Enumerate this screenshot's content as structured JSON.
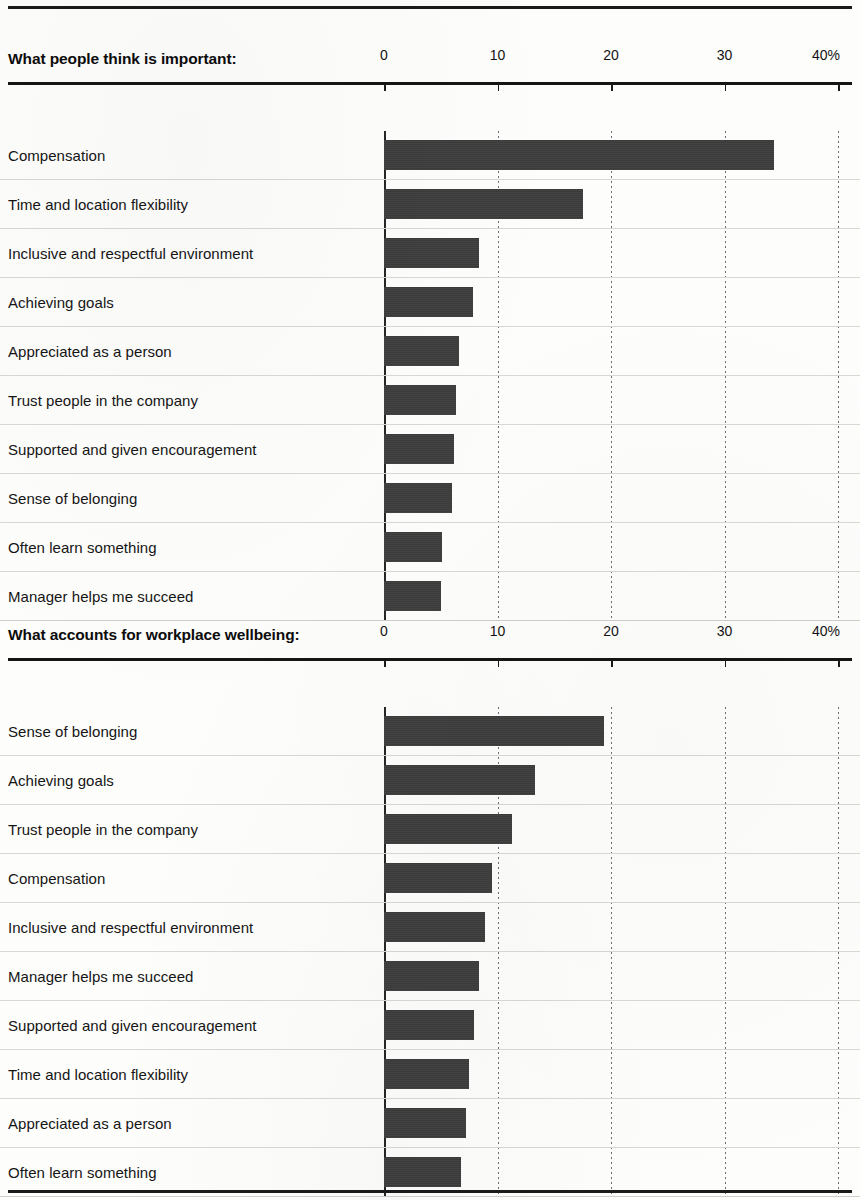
{
  "colors": {
    "bar": "#3b3b3b",
    "rule": "#1a1a1a",
    "gridline": "#6e6e6e",
    "text": "#151515",
    "background": "#fdfdfc"
  },
  "axis": {
    "ticks": [
      "0",
      "10",
      "20",
      "30",
      "40%"
    ],
    "min": 0,
    "max": 40,
    "unit": "%"
  },
  "charts": [
    {
      "title": "What people think is important:",
      "rows": [
        {
          "label": "Compensation",
          "value": 34.4
        },
        {
          "label": "Time and location flexibility",
          "value": 17.5
        },
        {
          "label": "Inclusive and respectful environment",
          "value": 8.4
        },
        {
          "label": "Achieving goals",
          "value": 7.8
        },
        {
          "label": "Appreciated as a person",
          "value": 6.6
        },
        {
          "label": "Trust people in the company",
          "value": 6.3
        },
        {
          "label": "Supported and given encouragement",
          "value": 6.2
        },
        {
          "label": "Sense of belonging",
          "value": 6.0
        },
        {
          "label": "Often learn something",
          "value": 5.1
        },
        {
          "label": "Manager helps me succeed",
          "value": 5.0
        }
      ]
    },
    {
      "title": "What accounts for workplace wellbeing:",
      "rows": [
        {
          "label": "Sense of belonging",
          "value": 19.4
        },
        {
          "label": "Achieving goals",
          "value": 13.3
        },
        {
          "label": "Trust people in the company",
          "value": 11.3
        },
        {
          "label": "Compensation",
          "value": 9.5
        },
        {
          "label": "Inclusive and respectful environment",
          "value": 8.9
        },
        {
          "label": "Manager helps me succeed",
          "value": 8.4
        },
        {
          "label": "Supported and given encouragement",
          "value": 7.9
        },
        {
          "label": "Time and location flexibility",
          "value": 7.5
        },
        {
          "label": "Appreciated as a person",
          "value": 7.2
        },
        {
          "label": "Often learn something",
          "value": 6.8
        }
      ]
    }
  ],
  "chart_data": [
    {
      "type": "bar",
      "orientation": "horizontal",
      "title": "What people think is important:",
      "xlabel": "",
      "ylabel": "",
      "xlim": [
        0,
        40
      ],
      "xticks": [
        0,
        10,
        20,
        30,
        40
      ],
      "xticklabels": [
        "0",
        "10",
        "20",
        "30",
        "40%"
      ],
      "grid": "vertical-dotted",
      "legend": "none",
      "categories": [
        "Compensation",
        "Time and location flexibility",
        "Inclusive and respectful environment",
        "Achieving goals",
        "Appreciated as a person",
        "Trust people in the company",
        "Supported and given encouragement",
        "Sense of belonging",
        "Often learn something",
        "Manager helps me succeed"
      ],
      "values": [
        34.4,
        17.5,
        8.4,
        7.8,
        6.6,
        6.3,
        6.2,
        6.0,
        5.1,
        5.0
      ]
    },
    {
      "type": "bar",
      "orientation": "horizontal",
      "title": "What accounts for workplace wellbeing:",
      "xlabel": "",
      "ylabel": "",
      "xlim": [
        0,
        40
      ],
      "xticks": [
        0,
        10,
        20,
        30,
        40
      ],
      "xticklabels": [
        "0",
        "10",
        "20",
        "30",
        "40%"
      ],
      "grid": "vertical-dotted",
      "legend": "none",
      "categories": [
        "Sense of belonging",
        "Achieving goals",
        "Trust people in the company",
        "Compensation",
        "Inclusive and respectful environment",
        "Manager helps me succeed",
        "Supported and given encouragement",
        "Time and location flexibility",
        "Appreciated as a person",
        "Often learn something"
      ],
      "values": [
        19.4,
        13.3,
        11.3,
        9.5,
        8.9,
        8.4,
        7.9,
        7.5,
        7.2,
        6.8
      ]
    }
  ]
}
